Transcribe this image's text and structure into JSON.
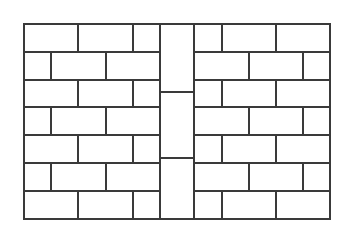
{
  "diagram": {
    "type": "brick-wall-pattern",
    "stroke_color": "#3a3a3a",
    "background": "#ffffff",
    "outer_box": {
      "x1": 24,
      "y1": 24,
      "x2": 330,
      "y2": 219
    },
    "row_lines_y": [
      24,
      52,
      80,
      107,
      135,
      163,
      191,
      219
    ],
    "left_panel": {
      "x1": 24,
      "x2": 160,
      "odd_row_joints_x": [
        78,
        133
      ],
      "even_row_joints_x": [
        51,
        106
      ]
    },
    "center_column": {
      "x1": 160,
      "x2": 194,
      "divisions_y": [
        92,
        158
      ]
    },
    "right_panel": {
      "x1": 194,
      "x2": 330,
      "odd_row_joints_x": [
        222,
        276
      ],
      "even_row_joints_x": [
        249,
        303
      ]
    },
    "rows": 7
  }
}
